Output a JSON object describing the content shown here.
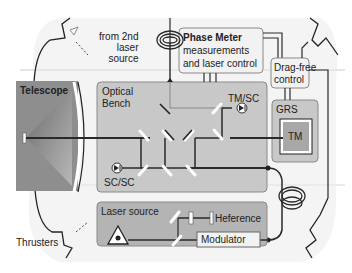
{
  "diagram": {
    "labels": {
      "from_laser": [
        "from 2nd",
        "laser",
        "source"
      ],
      "phase_meter_title": "Phase Meter",
      "phase_meter_sub1": "measurements",
      "phase_meter_sub2": "and laser control",
      "drag_free1": "Drag-free",
      "drag_free2": "control",
      "telescope": "Telescope",
      "optical_bench1": "Optical",
      "optical_bench2": "Bench",
      "tm_sc": "TM/SC",
      "sc_sc": "SC/SC",
      "grs": "GRS",
      "tm": "TM",
      "laser_source": "Laser source",
      "reference": "Heference",
      "modulator": "Modulator",
      "thrusters": "Thrusters"
    },
    "colors": {
      "background": "#ffffff",
      "spacecraft": "#f3f3f3",
      "box_fill": "#c8c8c8",
      "box_stroke": "#8a8a8a",
      "line": "#2a2a2a",
      "label_box": "#f2f2f2"
    }
  }
}
